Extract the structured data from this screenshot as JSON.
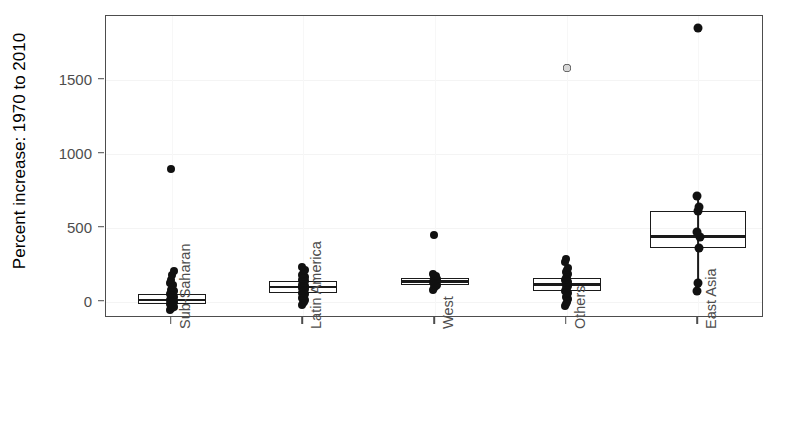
{
  "chart_data": {
    "type": "box",
    "title": "",
    "xlabel": "",
    "ylabel": "Percent increase: 1970 to 2010",
    "categories": [
      "Sub-Saharan",
      "Latin America",
      "West",
      "Others",
      "East Asia"
    ],
    "ylim": [
      -110,
      1930
    ],
    "yticks": [
      0,
      500,
      1000,
      1500
    ],
    "ytick_labels": [
      "0",
      "500",
      "1000",
      "1500"
    ],
    "grid": true,
    "legend": "none",
    "overlay": "jittered strip points over boxes",
    "boxes": [
      {
        "category": "Sub-Saharan",
        "q1": -12,
        "median": 12,
        "q3": 52,
        "whisker_low": -55,
        "whisker_high": 110,
        "outliers": [
          900,
          205,
          180
        ],
        "points": [
          -55,
          -45,
          -40,
          -35,
          -30,
          -25,
          -20,
          -15,
          -10,
          -5,
          0,
          5,
          10,
          12,
          15,
          20,
          25,
          30,
          35,
          40,
          45,
          50,
          55,
          60,
          70,
          80,
          95,
          110,
          130,
          150,
          180,
          205,
          900
        ]
      },
      {
        "category": "Latin America",
        "q1": 62,
        "median": 100,
        "q3": 140,
        "whisker_low": -20,
        "whisker_high": 215,
        "outliers": [
          232
        ],
        "points": [
          -20,
          -10,
          0,
          10,
          25,
          40,
          55,
          62,
          70,
          78,
          85,
          92,
          100,
          108,
          115,
          122,
          130,
          138,
          145,
          155,
          165,
          178,
          190,
          205,
          215,
          232
        ]
      },
      {
        "category": "West",
        "q1": 112,
        "median": 135,
        "q3": 158,
        "whisker_low": 82,
        "whisker_high": 190,
        "outliers": [
          450
        ],
        "points": [
          82,
          95,
          105,
          112,
          118,
          125,
          130,
          135,
          140,
          146,
          152,
          158,
          165,
          175,
          190,
          450
        ]
      },
      {
        "category": "Others",
        "q1": 72,
        "median": 116,
        "q3": 158,
        "whisker_low": -30,
        "whisker_high": 230,
        "outliers": [
          288,
          270,
          1580
        ],
        "points": [
          -30,
          -15,
          0,
          18,
          35,
          50,
          62,
          72,
          85,
          95,
          105,
          116,
          125,
          135,
          145,
          158,
          170,
          185,
          200,
          215,
          230,
          270,
          288,
          1580
        ]
      },
      {
        "category": "East Asia",
        "q1": 360,
        "median": 440,
        "q3": 610,
        "whisker_low": 75,
        "whisker_high": 715,
        "outliers": [
          1850
        ],
        "points": [
          75,
          130,
          360,
          440,
          470,
          610,
          640,
          715,
          1850
        ]
      }
    ]
  },
  "axis": {
    "y_title": "Percent increase: 1970 to 2010"
  },
  "colors": {
    "ink": "#1a1a1a",
    "axis": "#4d4d4d",
    "grid": "#f4f4f4",
    "background": "#ffffff",
    "ghost_point": "#d7d7d7"
  }
}
